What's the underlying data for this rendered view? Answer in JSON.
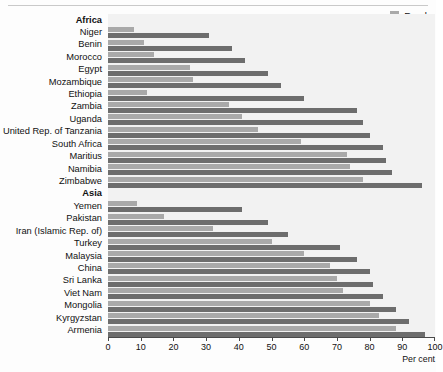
{
  "legend": {
    "position": "top-right",
    "items": [
      {
        "label": "Rural",
        "color": "#a9a9a9",
        "icon": "legend-swatch-icon"
      },
      {
        "label": "Urban",
        "color": "#6d6d6d",
        "icon": "legend-swatch-icon"
      }
    ]
  },
  "axis": {
    "title": "Per cent",
    "ticks": [
      "0",
      "10",
      "20",
      "30",
      "40",
      "50",
      "60",
      "70",
      "80",
      "90",
      "100"
    ]
  },
  "chart_data": {
    "type": "bar",
    "orientation": "horizontal",
    "title": "",
    "subtitle": "",
    "xlabel": "Per cent",
    "ylabel": "",
    "xlim": [
      0,
      100
    ],
    "xticks": [
      0,
      10,
      20,
      30,
      40,
      50,
      60,
      70,
      80,
      90,
      100
    ],
    "grid": false,
    "legend": [
      "Rural",
      "Urban"
    ],
    "legend_position": "top-right",
    "colors": {
      "Rural": "#a9a9a9",
      "Urban": "#6d6d6d"
    },
    "plot_background": "#f2f2f2",
    "categories": [
      "Africa",
      "Niger",
      "Benin",
      "Morocco",
      "Egypt",
      "Mozambique",
      "Ethiopia",
      "Zambia",
      "Uganda",
      "United Rep. of Tanzania",
      "South Africa",
      "Maritius",
      "Namibia",
      "Zimbabwe",
      "Asia",
      "Yemen",
      "Pakistan",
      "Iran (Islamic Rep. of)",
      "Turkey",
      "Malaysia",
      "China",
      "Sri Lanka",
      "Viet Nam",
      "Mongolia",
      "Kyrgyzstan",
      "Armenia"
    ],
    "group_headers": [
      "Africa",
      "Asia"
    ],
    "series": [
      {
        "name": "Rural",
        "values": [
          null,
          8,
          11,
          14,
          25,
          26,
          12,
          37,
          41,
          46,
          59,
          73,
          74,
          78,
          null,
          9,
          17,
          32,
          50,
          60,
          68,
          70,
          72,
          80,
          83,
          88
        ]
      },
      {
        "name": "Urban",
        "values": [
          null,
          31,
          38,
          42,
          49,
          53,
          60,
          76,
          78,
          80,
          84,
          85,
          87,
          96,
          null,
          41,
          49,
          55,
          71,
          76,
          80,
          81,
          84,
          88,
          92,
          97
        ]
      }
    ]
  }
}
